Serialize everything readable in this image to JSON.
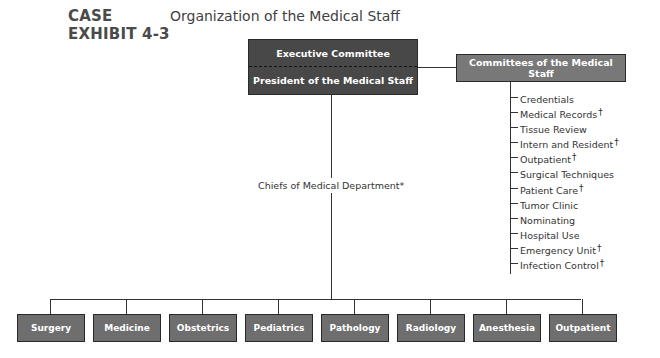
{
  "header": {
    "case_label_line1": "CASE",
    "case_label_line2": "EXHIBIT 4-3",
    "title": "Organization of the Medical Staff"
  },
  "top_box": {
    "upper_label": "Executive Committee",
    "lower_label": "President of the Medical Staff",
    "color": "#484848"
  },
  "committees_box": {
    "label": "Committees of the Medical Staff",
    "color": "#787878"
  },
  "committees": [
    {
      "label": "Credentials",
      "mark": ""
    },
    {
      "label": "Medical Records",
      "mark": "†"
    },
    {
      "label": "Tissue Review",
      "mark": ""
    },
    {
      "label": "Intern and Resident",
      "mark": "†"
    },
    {
      "label": "Outpatient",
      "mark": "†"
    },
    {
      "label": "Surgical Techniques",
      "mark": ""
    },
    {
      "label": "Patient Care",
      "mark": "†"
    },
    {
      "label": "Tumor Clinic",
      "mark": ""
    },
    {
      "label": "Nominating",
      "mark": ""
    },
    {
      "label": "Hospital Use",
      "mark": ""
    },
    {
      "label": "Emergency Unit",
      "mark": "†"
    },
    {
      "label": "Infection Control",
      "mark": "†"
    }
  ],
  "chiefs_label": "Chiefs of Medical Department*",
  "departments": [
    {
      "label": "Surgery"
    },
    {
      "label": "Medicine"
    },
    {
      "label": "Obstetrics"
    },
    {
      "label": "Pediatrics"
    },
    {
      "label": "Pathology"
    },
    {
      "label": "Radiology"
    },
    {
      "label": "Anesthesia"
    },
    {
      "label": "Outpatient"
    }
  ],
  "department_color": "#6e6e6e"
}
